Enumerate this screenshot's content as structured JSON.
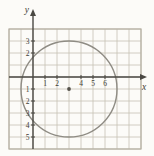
{
  "figure": {
    "kind": "math-graph",
    "x_axis_letter": "x",
    "y_axis_letter": "y"
  },
  "colors": {
    "background": "#fcfbf8",
    "grid_line": "#c6c1b4",
    "grid_border": "#b5b0a2",
    "axis": "#4a4843",
    "circle_stroke": "#8f8c84",
    "center_dot": "#55524b",
    "label_text": "#3e3b34"
  },
  "chart_data": {
    "type": "scatter",
    "subtype": "coordinate-plane-with-circle",
    "title": "",
    "xlabel": "x",
    "ylabel": "y",
    "grid": {
      "x_min": -2,
      "x_max": 9,
      "y_min": -6,
      "y_max": 4,
      "grid_on": true
    },
    "x_tick_labels": [
      {
        "value": 1,
        "label": "1"
      },
      {
        "value": 2,
        "label": "2"
      },
      {
        "value": 4,
        "label": "4"
      },
      {
        "value": 5,
        "label": "5"
      },
      {
        "value": 6,
        "label": "6"
      }
    ],
    "y_tick_labels": [
      {
        "value": 3,
        "label": "3"
      },
      {
        "value": 2,
        "label": "2"
      },
      {
        "value": -1,
        "label": "1"
      },
      {
        "value": -2,
        "label": "2"
      },
      {
        "value": -3,
        "label": "3"
      },
      {
        "value": -4,
        "label": "4"
      },
      {
        "value": -5,
        "label": "5"
      }
    ],
    "shapes": [
      {
        "kind": "circle",
        "center_x": 3,
        "center_y": -1,
        "radius": 4
      },
      {
        "kind": "point",
        "x": 3,
        "y": -1,
        "role": "circle-center"
      }
    ]
  }
}
